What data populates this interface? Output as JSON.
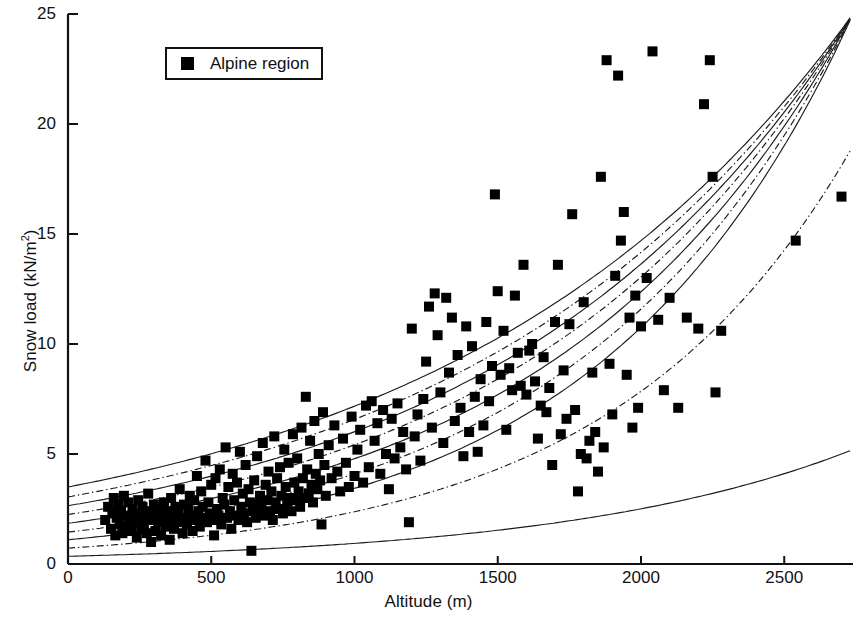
{
  "chart_data": {
    "type": "scatter",
    "title": "",
    "xlabel": "Altitude (m)",
    "ylabel": "Snow load (kN/m²)",
    "ylabel_base": "Snow load (kN/m",
    "ylabel_sup": "2",
    "ylabel_tail": ")",
    "xlim": [
      0,
      2740
    ],
    "ylim": [
      0,
      25
    ],
    "xticks": [
      0,
      500,
      1000,
      1500,
      2000,
      2500
    ],
    "xtick_labels": [
      "0",
      "500",
      "1000",
      "1500",
      "2000",
      "2500"
    ],
    "yticks": [
      0,
      5,
      10,
      15,
      20,
      25
    ],
    "ytick_labels": [
      "0",
      "5",
      "10",
      "15",
      "20",
      "25"
    ],
    "grid": false,
    "legend": {
      "position": "top-left",
      "boxed": true,
      "entries": [
        {
          "label": "Alpine region",
          "marker": "filled-square",
          "color": "#000000"
        }
      ]
    },
    "marker": {
      "shape": "square",
      "color": "#000000",
      "size_px": 10
    },
    "series": [
      {
        "name": "Alpine region",
        "marker": "filled-square",
        "color": "#000000",
        "n_points": 298,
        "points": [
          [
            130,
            2.0
          ],
          [
            140,
            2.6
          ],
          [
            150,
            1.6
          ],
          [
            155,
            2.3
          ],
          [
            160,
            3.0
          ],
          [
            165,
            1.3
          ],
          [
            170,
            2.1
          ],
          [
            175,
            2.7
          ],
          [
            180,
            1.8
          ],
          [
            185,
            2.4
          ],
          [
            190,
            1.4
          ],
          [
            195,
            3.1
          ],
          [
            200,
            2.2
          ],
          [
            205,
            1.7
          ],
          [
            210,
            2.8
          ],
          [
            215,
            2.0
          ],
          [
            220,
            1.5
          ],
          [
            225,
            2.5
          ],
          [
            230,
            1.9
          ],
          [
            235,
            2.3
          ],
          [
            240,
            1.2
          ],
          [
            245,
            2.9
          ],
          [
            250,
            2.1
          ],
          [
            255,
            1.6
          ],
          [
            260,
            2.6
          ],
          [
            265,
            1.8
          ],
          [
            270,
            2.2
          ],
          [
            275,
            1.4
          ],
          [
            280,
            3.2
          ],
          [
            285,
            2.4
          ],
          [
            290,
            1.0
          ],
          [
            295,
            2.0
          ],
          [
            300,
            2.7
          ],
          [
            305,
            1.5
          ],
          [
            310,
            2.3
          ],
          [
            315,
            1.9
          ],
          [
            320,
            2.5
          ],
          [
            325,
            1.3
          ],
          [
            330,
            2.1
          ],
          [
            335,
            2.8
          ],
          [
            340,
            1.7
          ],
          [
            345,
            2.4
          ],
          [
            350,
            2.0
          ],
          [
            355,
            1.1
          ],
          [
            360,
            3.0
          ],
          [
            365,
            2.2
          ],
          [
            370,
            1.6
          ],
          [
            375,
            2.6
          ],
          [
            380,
            1.9
          ],
          [
            385,
            2.3
          ],
          [
            390,
            3.4
          ],
          [
            395,
            2.0
          ],
          [
            400,
            1.4
          ],
          [
            405,
            2.7
          ],
          [
            410,
            2.1
          ],
          [
            415,
            1.8
          ],
          [
            420,
            2.5
          ],
          [
            425,
            3.1
          ],
          [
            430,
            2.2
          ],
          [
            435,
            1.5
          ],
          [
            440,
            2.9
          ],
          [
            445,
            2.0
          ],
          [
            450,
            4.0
          ],
          [
            455,
            2.4
          ],
          [
            460,
            1.7
          ],
          [
            465,
            3.3
          ],
          [
            470,
            2.6
          ],
          [
            475,
            2.1
          ],
          [
            480,
            4.7
          ],
          [
            485,
            1.9
          ],
          [
            490,
            2.8
          ],
          [
            495,
            2.3
          ],
          [
            500,
            3.6
          ],
          [
            505,
            2.0
          ],
          [
            510,
            1.3
          ],
          [
            515,
            3.9
          ],
          [
            520,
            2.5
          ],
          [
            525,
            2.2
          ],
          [
            530,
            4.3
          ],
          [
            535,
            1.8
          ],
          [
            540,
            3.0
          ],
          [
            545,
            2.7
          ],
          [
            550,
            5.3
          ],
          [
            555,
            2.1
          ],
          [
            560,
            3.5
          ],
          [
            565,
            2.4
          ],
          [
            570,
            1.6
          ],
          [
            575,
            4.1
          ],
          [
            580,
            2.9
          ],
          [
            585,
            2.2
          ],
          [
            590,
            3.7
          ],
          [
            595,
            2.0
          ],
          [
            600,
            5.1
          ],
          [
            605,
            2.6
          ],
          [
            610,
            3.2
          ],
          [
            615,
            2.3
          ],
          [
            620,
            4.5
          ],
          [
            625,
            1.9
          ],
          [
            630,
            3.4
          ],
          [
            635,
            2.8
          ],
          [
            640,
            0.6
          ],
          [
            645,
            2.4
          ],
          [
            650,
            3.8
          ],
          [
            655,
            2.1
          ],
          [
            660,
            4.9
          ],
          [
            665,
            2.7
          ],
          [
            670,
            3.1
          ],
          [
            675,
            2.5
          ],
          [
            680,
            5.5
          ],
          [
            685,
            2.2
          ],
          [
            690,
            3.6
          ],
          [
            695,
            2.9
          ],
          [
            700,
            4.2
          ],
          [
            705,
            2.4
          ],
          [
            710,
            3.3
          ],
          [
            715,
            2.0
          ],
          [
            720,
            5.8
          ],
          [
            725,
            2.8
          ],
          [
            730,
            3.9
          ],
          [
            735,
            2.5
          ],
          [
            740,
            4.4
          ],
          [
            745,
            3.1
          ],
          [
            750,
            2.3
          ],
          [
            755,
            5.2
          ],
          [
            760,
            3.5
          ],
          [
            765,
            2.7
          ],
          [
            770,
            4.6
          ],
          [
            775,
            3.0
          ],
          [
            780,
            2.4
          ],
          [
            785,
            5.9
          ],
          [
            790,
            3.7
          ],
          [
            795,
            2.9
          ],
          [
            800,
            4.8
          ],
          [
            805,
            3.3
          ],
          [
            810,
            2.6
          ],
          [
            815,
            6.2
          ],
          [
            820,
            3.9
          ],
          [
            825,
            3.0
          ],
          [
            830,
            7.6
          ],
          [
            835,
            4.3
          ],
          [
            840,
            3.2
          ],
          [
            845,
            5.6
          ],
          [
            850,
            3.6
          ],
          [
            855,
            2.8
          ],
          [
            860,
            6.5
          ],
          [
            865,
            4.1
          ],
          [
            870,
            3.4
          ],
          [
            875,
            5.0
          ],
          [
            880,
            3.8
          ],
          [
            885,
            1.8
          ],
          [
            890,
            6.9
          ],
          [
            895,
            4.5
          ],
          [
            900,
            3.1
          ],
          [
            910,
            5.4
          ],
          [
            920,
            3.9
          ],
          [
            930,
            6.3
          ],
          [
            940,
            4.2
          ],
          [
            950,
            3.3
          ],
          [
            960,
            5.7
          ],
          [
            970,
            4.6
          ],
          [
            980,
            3.5
          ],
          [
            990,
            6.7
          ],
          [
            1000,
            4.0
          ],
          [
            1010,
            5.2
          ],
          [
            1020,
            6.1
          ],
          [
            1030,
            3.7
          ],
          [
            1040,
            7.2
          ],
          [
            1050,
            4.4
          ],
          [
            1060,
            7.4
          ],
          [
            1070,
            5.6
          ],
          [
            1080,
            6.4
          ],
          [
            1090,
            4.1
          ],
          [
            1100,
            7.0
          ],
          [
            1110,
            5.0
          ],
          [
            1120,
            3.4
          ],
          [
            1130,
            6.6
          ],
          [
            1140,
            4.8
          ],
          [
            1150,
            7.3
          ],
          [
            1160,
            5.3
          ],
          [
            1170,
            6.0
          ],
          [
            1180,
            4.3
          ],
          [
            1190,
            1.9
          ],
          [
            1200,
            10.7
          ],
          [
            1210,
            5.8
          ],
          [
            1220,
            6.8
          ],
          [
            1230,
            4.7
          ],
          [
            1240,
            7.5
          ],
          [
            1250,
            9.2
          ],
          [
            1260,
            11.7
          ],
          [
            1270,
            6.2
          ],
          [
            1280,
            12.3
          ],
          [
            1290,
            10.4
          ],
          [
            1300,
            7.8
          ],
          [
            1310,
            5.5
          ],
          [
            1320,
            12.1
          ],
          [
            1330,
            8.7
          ],
          [
            1340,
            11.2
          ],
          [
            1350,
            6.5
          ],
          [
            1360,
            9.5
          ],
          [
            1370,
            7.1
          ],
          [
            1380,
            4.9
          ],
          [
            1390,
            10.8
          ],
          [
            1400,
            6.0
          ],
          [
            1410,
            9.9
          ],
          [
            1420,
            7.6
          ],
          [
            1430,
            5.1
          ],
          [
            1440,
            8.4
          ],
          [
            1450,
            6.3
          ],
          [
            1460,
            11.0
          ],
          [
            1470,
            7.4
          ],
          [
            1480,
            9.0
          ],
          [
            1490,
            16.8
          ],
          [
            1500,
            12.4
          ],
          [
            1510,
            8.6
          ],
          [
            1520,
            10.6
          ],
          [
            1530,
            6.1
          ],
          [
            1540,
            8.9
          ],
          [
            1550,
            7.9
          ],
          [
            1560,
            12.2
          ],
          [
            1570,
            9.6
          ],
          [
            1580,
            8.1
          ],
          [
            1590,
            13.6
          ],
          [
            1600,
            7.7
          ],
          [
            1610,
            9.7
          ],
          [
            1620,
            10.0
          ],
          [
            1630,
            8.3
          ],
          [
            1640,
            5.7
          ],
          [
            1650,
            7.2
          ],
          [
            1660,
            9.4
          ],
          [
            1670,
            6.9
          ],
          [
            1680,
            8.0
          ],
          [
            1690,
            4.5
          ],
          [
            1700,
            11.0
          ],
          [
            1710,
            13.6
          ],
          [
            1720,
            5.9
          ],
          [
            1730,
            8.8
          ],
          [
            1740,
            6.6
          ],
          [
            1750,
            10.9
          ],
          [
            1760,
            15.9
          ],
          [
            1770,
            7.0
          ],
          [
            1780,
            3.3
          ],
          [
            1790,
            5.0
          ],
          [
            1800,
            11.9
          ],
          [
            1810,
            4.8
          ],
          [
            1820,
            5.6
          ],
          [
            1830,
            8.7
          ],
          [
            1840,
            6.0
          ],
          [
            1850,
            4.2
          ],
          [
            1860,
            17.6
          ],
          [
            1870,
            5.3
          ],
          [
            1880,
            22.9
          ],
          [
            1890,
            9.1
          ],
          [
            1900,
            6.8
          ],
          [
            1910,
            13.1
          ],
          [
            1920,
            22.2
          ],
          [
            1930,
            14.7
          ],
          [
            1940,
            16.0
          ],
          [
            1950,
            8.6
          ],
          [
            1960,
            11.2
          ],
          [
            1970,
            6.2
          ],
          [
            1980,
            12.2
          ],
          [
            1990,
            7.1
          ],
          [
            2000,
            10.8
          ],
          [
            2020,
            13.0
          ],
          [
            2040,
            23.3
          ],
          [
            2060,
            11.1
          ],
          [
            2080,
            7.9
          ],
          [
            2100,
            12.1
          ],
          [
            2130,
            7.1
          ],
          [
            2160,
            11.2
          ],
          [
            2200,
            10.7
          ],
          [
            2220,
            20.9
          ],
          [
            2240,
            22.9
          ],
          [
            2250,
            17.6
          ],
          [
            2260,
            7.8
          ],
          [
            2280,
            10.6
          ],
          [
            2540,
            14.7
          ],
          [
            2700,
            16.7
          ]
        ]
      }
    ],
    "curves": {
      "description": "Family of exponential snow-load / altitude reference curves",
      "count": 9,
      "model": "y = a * exp(b * altitude)",
      "lines": [
        {
          "id": "curve-1",
          "style": "solid",
          "intercept": 3.5,
          "value_at_2740": 25.0
        },
        {
          "id": "curve-2",
          "style": "dashdot",
          "intercept": 3.05,
          "value_at_2740": 25.0
        },
        {
          "id": "curve-3",
          "style": "solid",
          "intercept": 2.65,
          "value_at_2740": 25.0
        },
        {
          "id": "curve-4",
          "style": "dashdot",
          "intercept": 2.25,
          "value_at_2740": 25.0
        },
        {
          "id": "curve-5",
          "style": "solid",
          "intercept": 1.85,
          "value_at_2740": 25.0
        },
        {
          "id": "curve-6",
          "style": "dashdot",
          "intercept": 1.45,
          "value_at_2740": 25.0
        },
        {
          "id": "curve-7",
          "style": "solid",
          "intercept": 1.1,
          "value_at_2740": 25.0
        },
        {
          "id": "curve-8",
          "style": "dashdot",
          "intercept": 0.72,
          "value_at_2740": 19.0
        },
        {
          "id": "curve-9",
          "style": "solid",
          "intercept": 0.35,
          "value_at_2740": 5.2
        }
      ]
    }
  }
}
